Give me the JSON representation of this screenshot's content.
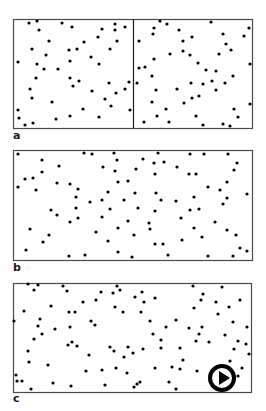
{
  "figure": {
    "background": "#ffffff",
    "stroke_color": "#4a4a4a",
    "dot_color": "#000000",
    "dot_radius": 1.6,
    "panels": [
      {
        "id": "a",
        "label": "a",
        "label_pos": [
          13,
          139
        ],
        "box": {
          "x": 13,
          "y": 19,
          "w": 239,
          "h": 109
        },
        "divider_x": 133,
        "dots": [
          [
            29,
            23
          ],
          [
            37,
            21
          ],
          [
            62,
            23
          ],
          [
            72,
            27
          ],
          [
            115,
            24
          ],
          [
            125,
            27
          ],
          [
            39,
            30
          ],
          [
            102,
            29
          ],
          [
            115,
            30
          ],
          [
            49,
            41
          ],
          [
            98,
            37
          ],
          [
            84,
            42
          ],
          [
            117,
            41
          ],
          [
            32,
            49
          ],
          [
            69,
            50
          ],
          [
            77,
            49
          ],
          [
            110,
            49
          ],
          [
            46,
            55
          ],
          [
            91,
            57
          ],
          [
            18,
            62
          ],
          [
            70,
            61
          ],
          [
            37,
            64
          ],
          [
            99,
            64
          ],
          [
            44,
            69
          ],
          [
            58,
            69
          ],
          [
            36,
            78
          ],
          [
            70,
            78
          ],
          [
            79,
            81
          ],
          [
            73,
            86
          ],
          [
            109,
            83
          ],
          [
            129,
            82
          ],
          [
            30,
            89
          ],
          [
            92,
            91
          ],
          [
            125,
            89
          ],
          [
            116,
            93
          ],
          [
            32,
            98
          ],
          [
            105,
            99
          ],
          [
            52,
            102
          ],
          [
            111,
            106
          ],
          [
            18,
            110
          ],
          [
            83,
            109
          ],
          [
            130,
            110
          ],
          [
            19,
            118
          ],
          [
            56,
            119
          ],
          [
            70,
            116
          ],
          [
            99,
            117
          ],
          [
            33,
            123
          ],
          [
            25,
            125
          ],
          [
            160,
            21
          ],
          [
            167,
            24
          ],
          [
            211,
            22
          ],
          [
            154,
            28
          ],
          [
            153,
            34
          ],
          [
            179,
            30
          ],
          [
            249,
            28
          ],
          [
            223,
            34
          ],
          [
            244,
            36
          ],
          [
            139,
            41
          ],
          [
            183,
            41
          ],
          [
            192,
            37
          ],
          [
            226,
            44
          ],
          [
            231,
            50
          ],
          [
            183,
            51
          ],
          [
            170,
            54
          ],
          [
            190,
            55
          ],
          [
            219,
            54
          ],
          [
            154,
            59
          ],
          [
            198,
            63
          ],
          [
            250,
            64
          ],
          [
            139,
            68
          ],
          [
            145,
            67
          ],
          [
            206,
            70
          ],
          [
            216,
            71
          ],
          [
            233,
            76
          ],
          [
            152,
            76
          ],
          [
            137,
            83
          ],
          [
            191,
            83
          ],
          [
            203,
            84
          ],
          [
            212,
            81
          ],
          [
            225,
            83
          ],
          [
            156,
            90
          ],
          [
            177,
            89
          ],
          [
            216,
            90
          ],
          [
            199,
            96
          ],
          [
            192,
            98
          ],
          [
            152,
            102
          ],
          [
            184,
            103
          ],
          [
            250,
            104
          ],
          [
            166,
            109
          ],
          [
            234,
            109
          ],
          [
            157,
            116
          ],
          [
            196,
            116
          ],
          [
            238,
            117
          ],
          [
            144,
            122
          ],
          [
            169,
            122
          ],
          [
            203,
            125
          ],
          [
            223,
            124
          ],
          [
            230,
            126
          ]
        ]
      },
      {
        "id": "b",
        "label": "b",
        "label_pos": [
          13,
          271
        ],
        "box": {
          "x": 13,
          "y": 150,
          "w": 239,
          "h": 110
        },
        "divider_x": null,
        "dots": [
          [
            18,
            154
          ],
          [
            84,
            153
          ],
          [
            92,
            154
          ],
          [
            114,
            153
          ],
          [
            158,
            153
          ],
          [
            190,
            154
          ],
          [
            204,
            154
          ],
          [
            228,
            154
          ],
          [
            42,
            160
          ],
          [
            117,
            160
          ],
          [
            143,
            159
          ],
          [
            154,
            163
          ],
          [
            164,
            162
          ],
          [
            237,
            163
          ],
          [
            59,
            166
          ],
          [
            103,
            167
          ],
          [
            177,
            167
          ],
          [
            136,
            169
          ],
          [
            234,
            170
          ],
          [
            42,
            172
          ],
          [
            115,
            171
          ],
          [
            155,
            174
          ],
          [
            189,
            174
          ],
          [
            196,
            174
          ],
          [
            25,
            179
          ],
          [
            33,
            178
          ],
          [
            128,
            181
          ],
          [
            118,
            182
          ],
          [
            57,
            183
          ],
          [
            227,
            182
          ],
          [
            70,
            184
          ],
          [
            18,
            187
          ],
          [
            208,
            187
          ],
          [
            36,
            190
          ],
          [
            78,
            189
          ],
          [
            220,
            190
          ],
          [
            108,
            192
          ],
          [
            135,
            193
          ],
          [
            156,
            193
          ],
          [
            247,
            194
          ],
          [
            76,
            197
          ],
          [
            194,
            197
          ],
          [
            227,
            198
          ],
          [
            124,
            200
          ],
          [
            161,
            200
          ],
          [
            90,
            202
          ],
          [
            102,
            200
          ],
          [
            176,
            201
          ],
          [
            223,
            204
          ],
          [
            76,
            208
          ],
          [
            51,
            210
          ],
          [
            110,
            209
          ],
          [
            138,
            208
          ],
          [
            155,
            211
          ],
          [
            190,
            210
          ],
          [
            199,
            209
          ],
          [
            57,
            215
          ],
          [
            102,
            217
          ],
          [
            78,
            218
          ],
          [
            181,
            218
          ],
          [
            128,
            221
          ],
          [
            70,
            222
          ],
          [
            149,
            223
          ],
          [
            215,
            222
          ],
          [
            30,
            229
          ],
          [
            118,
            228
          ],
          [
            150,
            229
          ],
          [
            194,
            228
          ],
          [
            227,
            230
          ],
          [
            96,
            232
          ],
          [
            49,
            235
          ],
          [
            134,
            235
          ],
          [
            236,
            235
          ],
          [
            202,
            237
          ],
          [
            108,
            241
          ],
          [
            182,
            240
          ],
          [
            43,
            242
          ],
          [
            155,
            244
          ],
          [
            163,
            244
          ],
          [
            240,
            248
          ],
          [
            26,
            250
          ],
          [
            118,
            252
          ],
          [
            247,
            251
          ],
          [
            168,
            255
          ],
          [
            69,
            256
          ],
          [
            85,
            255
          ],
          [
            132,
            257
          ],
          [
            208,
            256
          ],
          [
            233,
            256
          ]
        ]
      },
      {
        "id": "c",
        "label": "c",
        "label_pos": [
          13,
          402
        ],
        "box": {
          "x": 13,
          "y": 283,
          "w": 238,
          "h": 109
        },
        "divider_x": null,
        "dots": [
          [
            28,
            284
          ],
          [
            38,
            285
          ],
          [
            63,
            286
          ],
          [
            117,
            286
          ],
          [
            193,
            286
          ],
          [
            222,
            287
          ],
          [
            34,
            290
          ],
          [
            67,
            291
          ],
          [
            120,
            290
          ],
          [
            101,
            292
          ],
          [
            113,
            293
          ],
          [
            142,
            292
          ],
          [
            203,
            294
          ],
          [
            135,
            297
          ],
          [
            155,
            298
          ],
          [
            96,
            300
          ],
          [
            144,
            302
          ],
          [
            201,
            300
          ],
          [
            216,
            302
          ],
          [
            240,
            300
          ],
          [
            83,
            302
          ],
          [
            51,
            306
          ],
          [
            115,
            307
          ],
          [
            194,
            308
          ],
          [
            229,
            307
          ],
          [
            24,
            311
          ],
          [
            69,
            312
          ],
          [
            75,
            312
          ],
          [
            123,
            312
          ],
          [
            141,
            312
          ],
          [
            218,
            314
          ],
          [
            40,
            319
          ],
          [
            14,
            321
          ],
          [
            91,
            321
          ],
          [
            150,
            321
          ],
          [
            176,
            320
          ],
          [
            233,
            322
          ],
          [
            38,
            326
          ],
          [
            95,
            325
          ],
          [
            70,
            327
          ],
          [
            202,
            327
          ],
          [
            166,
            327
          ],
          [
            189,
            328
          ],
          [
            247,
            327
          ],
          [
            55,
            329
          ],
          [
            42,
            334
          ],
          [
            153,
            334
          ],
          [
            199,
            334
          ],
          [
            225,
            335
          ],
          [
            34,
            339
          ],
          [
            161,
            340
          ],
          [
            196,
            341
          ],
          [
            209,
            342
          ],
          [
            238,
            341
          ],
          [
            72,
            342
          ],
          [
            68,
            345
          ],
          [
            77,
            346
          ],
          [
            246,
            344
          ],
          [
            110,
            347
          ],
          [
            128,
            347
          ],
          [
            180,
            348
          ],
          [
            161,
            348
          ],
          [
            143,
            349
          ],
          [
            234,
            349
          ],
          [
            28,
            351
          ],
          [
            114,
            351
          ],
          [
            133,
            353
          ],
          [
            89,
            355
          ],
          [
            249,
            354
          ],
          [
            124,
            357
          ],
          [
            183,
            360
          ],
          [
            230,
            361
          ],
          [
            29,
            362
          ],
          [
            48,
            365
          ],
          [
            172,
            367
          ],
          [
            242,
            368
          ],
          [
            116,
            368
          ],
          [
            155,
            368
          ],
          [
            180,
            369
          ],
          [
            102,
            370
          ],
          [
            86,
            371
          ],
          [
            197,
            371
          ],
          [
            127,
            373
          ],
          [
            16,
            375
          ],
          [
            238,
            376
          ],
          [
            17,
            381
          ],
          [
            22,
            381
          ],
          [
            140,
            382
          ],
          [
            137,
            384
          ],
          [
            169,
            382
          ],
          [
            53,
            383
          ],
          [
            105,
            385
          ],
          [
            134,
            387
          ],
          [
            71,
            386
          ],
          [
            31,
            389
          ],
          [
            176,
            389
          ]
        ]
      }
    ],
    "play_button": {
      "icon": "play-circle-icon",
      "center": [
        222,
        378
      ],
      "diameter": 28
    }
  }
}
